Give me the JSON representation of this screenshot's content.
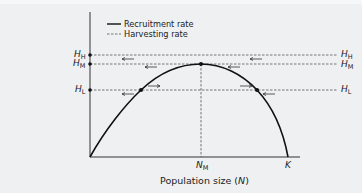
{
  "diagram": {
    "title": "",
    "legend": [
      {
        "style": "solid",
        "label": "Recruitment rate"
      },
      {
        "style": "dashed",
        "label": "Harvesting rate"
      }
    ],
    "y_axis": {
      "labels": [
        {
          "main": "H",
          "sub": "H",
          "level": "high"
        },
        {
          "main": "H",
          "sub": "M",
          "level": "medium"
        },
        {
          "main": "H",
          "sub": "L",
          "level": "low"
        }
      ]
    },
    "x_axis": {
      "label_prefix": "Population size (",
      "label_var": "N",
      "label_suffix": ")",
      "ticks": [
        {
          "main": "N",
          "sub": "M"
        },
        {
          "main": "K",
          "sub": ""
        }
      ]
    },
    "right_labels": [
      {
        "main": "H",
        "sub": "H"
      },
      {
        "main": "H",
        "sub": "M"
      },
      {
        "main": "H",
        "sub": "L"
      }
    ],
    "colors": {
      "background": "#eef0f2",
      "curve": "#111111",
      "dashed": "#555555",
      "axis": "#333333"
    }
  }
}
